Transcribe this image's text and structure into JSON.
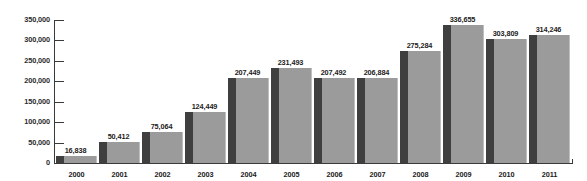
{
  "chart_data": {
    "type": "bar",
    "title": "",
    "subtitle": "",
    "xlabel": "",
    "ylabel": "",
    "categories": [
      "2000",
      "2001",
      "2002",
      "2003",
      "2004",
      "2005",
      "2006",
      "2007",
      "2008",
      "2009",
      "2010",
      "2011"
    ],
    "values": [
      16838,
      50412,
      75064,
      124449,
      207449,
      231493,
      207492,
      206884,
      275284,
      336655,
      303809,
      314246
    ],
    "value_labels": [
      "16,838",
      "50,412",
      "75,064",
      "124,449",
      "207,449",
      "231,493",
      "207,492",
      "206,884",
      "275,284",
      "336,655",
      "303,809",
      "314,246"
    ],
    "ylim": [
      0,
      350000
    ],
    "y_ticks": [
      0,
      50000,
      100000,
      150000,
      200000,
      250000,
      300000,
      350000
    ],
    "y_tick_labels": [
      "0",
      "50,000",
      "100,000",
      "150,000",
      "200,000",
      "250,000",
      "300,000",
      "350,000"
    ],
    "grid": false,
    "legend": null,
    "legend_position": "none",
    "colors": {
      "bar_face": "#9b9b9b",
      "bar_side": "#3f3f3f",
      "axis": "#3a3a3a",
      "text": "#1c1c1c",
      "background": "#ffffff"
    }
  }
}
